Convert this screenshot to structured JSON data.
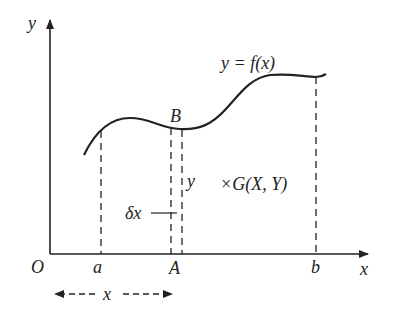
{
  "diagram": {
    "axes": {
      "y_label": "y",
      "x_label": "x",
      "origin_label": "O"
    },
    "curve_label": "y = f(x)",
    "points": {
      "B": "B"
    },
    "x_ticks": {
      "a": "a",
      "A": "A",
      "b": "b"
    },
    "strip": {
      "height_label": "y",
      "width_label": "δx"
    },
    "centroid_label": "×G(X, Y)",
    "distance_label": "x",
    "colors": {
      "ink": "#222222",
      "background": "#ffffff"
    }
  }
}
